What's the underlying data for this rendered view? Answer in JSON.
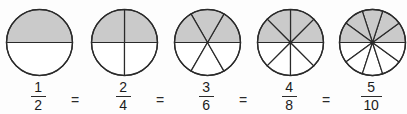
{
  "figure": {
    "kind": "equivalent-fractions-pie-diagram",
    "background_color": "#fdfdfd",
    "shaded_color": "#cacaca",
    "unshaded_color": "#ffffff",
    "stroke_color": "#2a2a2a",
    "equals_label": "="
  },
  "chart_data": {
    "type": "pie",
    "title": "",
    "xlabel": "",
    "ylabel": "",
    "legend": [],
    "grid": false,
    "categories": [
      "1/2",
      "2/4",
      "3/6",
      "4/8",
      "5/10"
    ],
    "values": [
      0.5,
      0.5,
      0.5,
      0.5,
      0.5
    ],
    "circles": [
      {
        "id": "circle-2",
        "center_x": 38,
        "center_y": 42,
        "radius": 33,
        "total_slices": 2,
        "shaded_slices": 1,
        "numerator": "1",
        "denominator": "2",
        "fraction_label": "1/2"
      },
      {
        "id": "circle-4",
        "center_x": 123,
        "center_y": 42,
        "radius": 33,
        "total_slices": 4,
        "shaded_slices": 2,
        "numerator": "2",
        "denominator": "4",
        "fraction_label": "2/4"
      },
      {
        "id": "circle-6",
        "center_x": 206,
        "center_y": 42,
        "radius": 33,
        "total_slices": 6,
        "shaded_slices": 3,
        "numerator": "3",
        "denominator": "6",
        "fraction_label": "3/6"
      },
      {
        "id": "circle-8",
        "center_x": 289,
        "center_y": 42,
        "radius": 33,
        "total_slices": 8,
        "shaded_slices": 4,
        "numerator": "4",
        "denominator": "8",
        "fraction_label": "4/8"
      },
      {
        "id": "circle-10",
        "center_x": 371,
        "center_y": 42,
        "radius": 33,
        "total_slices": 10,
        "shaded_slices": 5,
        "numerator": "5",
        "denominator": "10",
        "fraction_label": "5/10"
      }
    ]
  },
  "fractions": [
    {
      "numerator": "1",
      "denominator": "2"
    },
    {
      "numerator": "2",
      "denominator": "4"
    },
    {
      "numerator": "3",
      "denominator": "6"
    },
    {
      "numerator": "4",
      "denominator": "8"
    },
    {
      "numerator": "5",
      "denominator": "10"
    }
  ],
  "operators": [
    "=",
    "=",
    "=",
    "="
  ]
}
